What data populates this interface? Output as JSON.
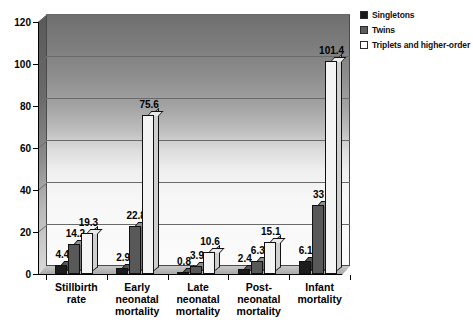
{
  "chart_data": {
    "type": "bar",
    "title": "",
    "subtitle": "",
    "xlabel": "",
    "ylabel": "",
    "ylim": [
      0,
      120
    ],
    "yticks": [
      0,
      20,
      40,
      60,
      80,
      100,
      120
    ],
    "grid": true,
    "legend_position": "top-right",
    "categories": [
      "Stillbirth\nrate",
      "Early\nneonatal\nmortality",
      "Late\nneonatal\nmortality",
      "Post-\nneonatal\nmortality",
      "Infant\nmortality"
    ],
    "series": [
      {
        "name": "Singletons",
        "color": "#1c1c1c",
        "values": [
          4.4,
          2.9,
          0.8,
          2.4,
          6.1
        ],
        "labels": [
          "4.4",
          "2.9",
          "0.8",
          "2.4",
          "6.1"
        ]
      },
      {
        "name": "Twins",
        "color": "#585858",
        "values": [
          14.2,
          22.8,
          3.9,
          6.3,
          33
        ],
        "labels": [
          "14.2",
          "22.8",
          "3.9",
          "6.3",
          "33"
        ]
      },
      {
        "name": "Triplets and higher-order",
        "color": "#f4f4f4",
        "values": [
          19.3,
          75.6,
          10.6,
          15.1,
          101.4
        ],
        "labels": [
          "19.3",
          "75.6",
          "10.6",
          "15.1",
          "101.4"
        ]
      }
    ]
  },
  "legend": {
    "items": [
      {
        "label": "Singletons",
        "swatch": "singletons"
      },
      {
        "label": "Twins",
        "swatch": "twins"
      },
      {
        "label": "Triplets and higher-order",
        "swatch": "triplets"
      }
    ]
  },
  "axis": {
    "y_tick_labels": [
      "120",
      "100",
      "80",
      "60",
      "40",
      "20",
      "0"
    ]
  }
}
